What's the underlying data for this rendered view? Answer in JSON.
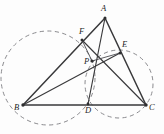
{
  "figure": {
    "background_color": "#fdfdfd",
    "stroke_color": "#3a3a3c",
    "dash_color": "#8a8a8e",
    "label_color": "#1d1d1f",
    "points": [
      {
        "id": "A",
        "label": "A",
        "x": 105,
        "y": 18,
        "label_x": 101,
        "label_y": 4
      },
      {
        "id": "B",
        "label": "B",
        "x": 23,
        "y": 105,
        "label_x": 14,
        "label_y": 103
      },
      {
        "id": "C",
        "label": "C",
        "x": 146,
        "y": 105,
        "label_x": 149,
        "label_y": 103
      },
      {
        "id": "D",
        "label": "D",
        "x": 88,
        "y": 104,
        "label_x": 85,
        "label_y": 106
      },
      {
        "id": "E",
        "label": "E",
        "x": 120,
        "y": 53,
        "label_x": 122,
        "label_y": 40
      },
      {
        "id": "F",
        "label": "F",
        "x": 82,
        "y": 40,
        "label_x": 79,
        "label_y": 27
      },
      {
        "id": "P",
        "label": "P",
        "x": 92,
        "y": 61,
        "label_x": 84,
        "label_y": 57
      }
    ],
    "segments": [
      {
        "name": "side-AB",
        "from": "A",
        "to": "B"
      },
      {
        "name": "side-AC",
        "from": "A",
        "to": "C"
      },
      {
        "name": "side-BC",
        "from": "B",
        "to": "C"
      },
      {
        "name": "cevian-AD",
        "from": "A",
        "to": "D"
      },
      {
        "name": "cevian-BE",
        "from": "B",
        "to": "E"
      },
      {
        "name": "cevian-CF",
        "from": "C",
        "to": "F"
      },
      {
        "name": "segment-PE",
        "from": "P",
        "to": "E"
      },
      {
        "name": "segment-PF",
        "from": "P",
        "to": "F"
      }
    ],
    "circles": [
      {
        "name": "circumcircle-large",
        "cx": 48,
        "cy": 78,
        "r": 47
      },
      {
        "name": "circle-small",
        "cx": 119,
        "cy": 84,
        "r": 34
      }
    ]
  }
}
